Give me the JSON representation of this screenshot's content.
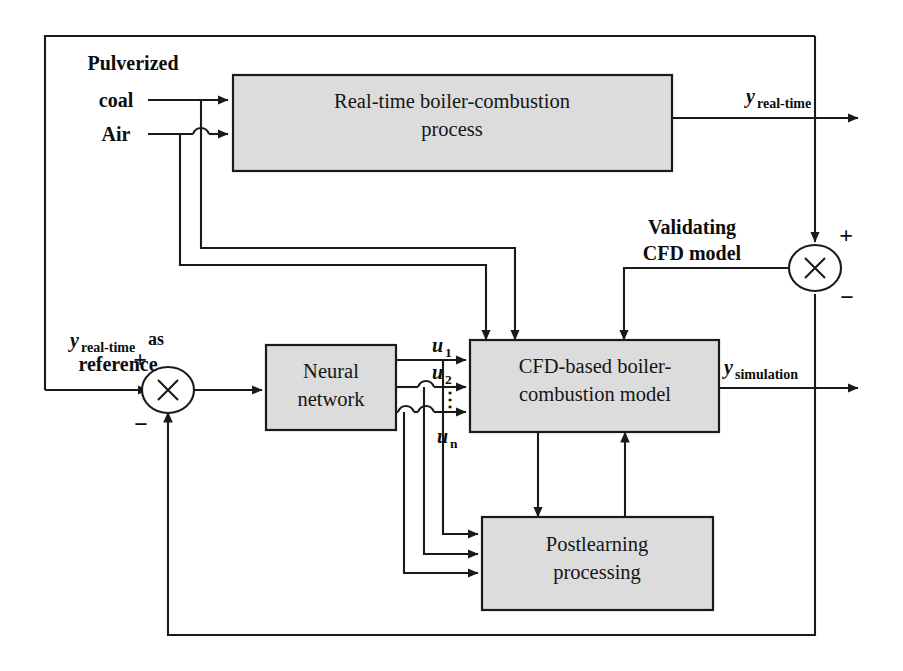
{
  "diagram": {
    "colors": {
      "box_fill": "#dcdcdc",
      "line": "#1a1a1a",
      "background": "#ffffff",
      "text": "#111111"
    },
    "boxes": [
      {
        "id": "real-time-process",
        "line1": "Real-time boiler-combustion",
        "line2": "process"
      },
      {
        "id": "neural-network",
        "line1": "Neural",
        "line2": "network"
      },
      {
        "id": "cfd-model",
        "line1": "CFD-based boiler-",
        "line2": "combustion model"
      },
      {
        "id": "postlearning",
        "line1": "Postlearning",
        "line2": "processing"
      }
    ],
    "inputs": {
      "pulverized": "Pulverized",
      "coal": "coal",
      "air": "Air"
    },
    "signals": {
      "y_symbol": "y",
      "y_realtime_sub": "real-time",
      "y_simulation_sub": "simulation",
      "reference_as": "as",
      "reference_word": "reference",
      "u_symbol": "u",
      "u1_sub": "1",
      "u2_sub": "2",
      "un_sub": "n",
      "u_vdots": "⋮"
    },
    "annotations": {
      "validating_line1": "Validating",
      "validating_line2": "CFD model"
    },
    "signs": {
      "plus": "+",
      "minus": "−"
    },
    "junctions": {
      "multiply_glyph": "×",
      "left_id": "error-summing-junction",
      "right_id": "validation-summing-junction"
    }
  }
}
